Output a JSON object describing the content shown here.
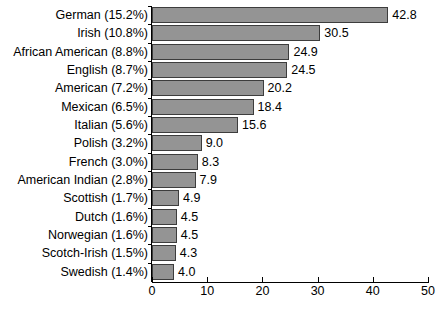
{
  "chart_data": {
    "type": "bar",
    "orientation": "horizontal",
    "title": "",
    "subtitle": "",
    "xlabel": "",
    "ylabel": "",
    "xlim": [
      0,
      50
    ],
    "xticks": [
      0,
      10,
      20,
      30,
      40,
      50
    ],
    "xtick_labels": [
      "0",
      "10",
      "20",
      "30",
      "40",
      "50"
    ],
    "grid": false,
    "legend": null,
    "bar_color": "#949494",
    "bar_edge_color": "#3d3d3d",
    "background_color": "#ffffff",
    "text_color": "#000000",
    "categories": [
      "German (15.2%)",
      "Irish (10.8%)",
      "African American (8.8%)",
      "English (8.7%)",
      "American (7.2%)",
      "Mexican (6.5%)",
      "Italian (5.6%)",
      "Polish (3.2%)",
      "French (3.0%)",
      "American Indian (2.8%)",
      "Scottish (1.7%)",
      "Dutch (1.6%)",
      "Norwegian (1.6%)",
      "Scotch-Irish (1.5%)",
      "Swedish (1.4%)"
    ],
    "values": [
      42.8,
      30.5,
      24.9,
      24.5,
      20.2,
      18.4,
      15.6,
      9.0,
      8.3,
      7.9,
      4.9,
      4.5,
      4.5,
      4.3,
      4.0
    ],
    "value_labels": [
      "42.8",
      "30.5",
      "24.9",
      "24.5",
      "20.2",
      "18.4",
      "15.6",
      "9.0",
      "8.3",
      "7.9",
      "4.9",
      "4.5",
      "4.5",
      "4.3",
      "4.0"
    ]
  }
}
